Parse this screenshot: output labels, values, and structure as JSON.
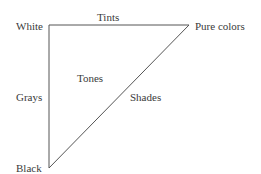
{
  "diagram": {
    "vertices": {
      "white": "White",
      "pure_colors": "Pure colors",
      "black": "Black"
    },
    "edges": {
      "top": "Tints",
      "left": "Grays",
      "diagonal": "Shades"
    },
    "interior": "Tones",
    "line_color": "#555555"
  }
}
